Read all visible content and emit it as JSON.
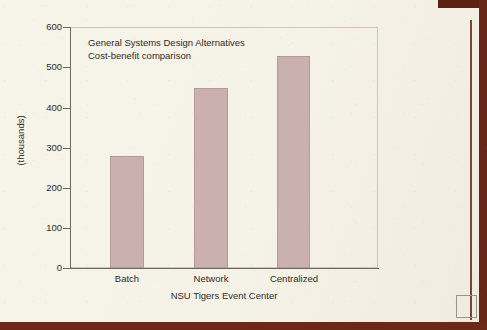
{
  "chart_data": {
    "type": "bar",
    "title": "",
    "annotation_lines": [
      "General Systems Design Alternatives",
      "Cost-benefit comparison"
    ],
    "categories": [
      "Batch",
      "Network",
      "Centralized"
    ],
    "values": [
      279,
      448,
      528
    ],
    "xlabel": "NSU Tigers Event Center",
    "ylabel": "(thousands)",
    "ylim": [
      0,
      600
    ],
    "ytick_labels": [
      "0",
      "100",
      "200",
      "300",
      "400",
      "500",
      "600"
    ],
    "ytick_values": [
      0,
      100,
      200,
      300,
      400,
      500,
      600
    ],
    "grid": false,
    "legend": false,
    "bar_color": "#cbb0b0",
    "bar_edge_color": "#b59a9a",
    "axis_color": "#6c6a63",
    "frame_color": "#d8bfb8",
    "background_color": "#f6f3e9"
  },
  "scan_artifacts": {
    "binder_color": "#66271a",
    "corner_square_color": "#9a958a"
  }
}
